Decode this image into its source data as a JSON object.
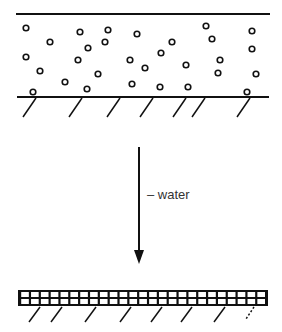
{
  "diagram": {
    "arrow_label": "– water",
    "top_state": {
      "description": "suspended particles between two horizontal lines on hatched substrate",
      "particles": [
        [
          26,
          28
        ],
        [
          50,
          42
        ],
        [
          80,
          32
        ],
        [
          108,
          30
        ],
        [
          137,
          34
        ],
        [
          206,
          26
        ],
        [
          252,
          31
        ],
        [
          88,
          48
        ],
        [
          105,
          42
        ],
        [
          172,
          42
        ],
        [
          212,
          39
        ],
        [
          252,
          49
        ],
        [
          26,
          57
        ],
        [
          78,
          60
        ],
        [
          161,
          53
        ],
        [
          220,
          60
        ],
        [
          40,
          71
        ],
        [
          98,
          74
        ],
        [
          130,
          60
        ],
        [
          145,
          68
        ],
        [
          186,
          65
        ],
        [
          218,
          73
        ],
        [
          256,
          74
        ],
        [
          65,
          82
        ],
        [
          132,
          84
        ],
        [
          160,
          87
        ],
        [
          188,
          87
        ],
        [
          33,
          92
        ],
        [
          87,
          89
        ],
        [
          247,
          92
        ]
      ]
    },
    "bottom_state": {
      "description": "dense packed grid layer on hatched substrate",
      "columns": 25,
      "rows": 2
    }
  }
}
